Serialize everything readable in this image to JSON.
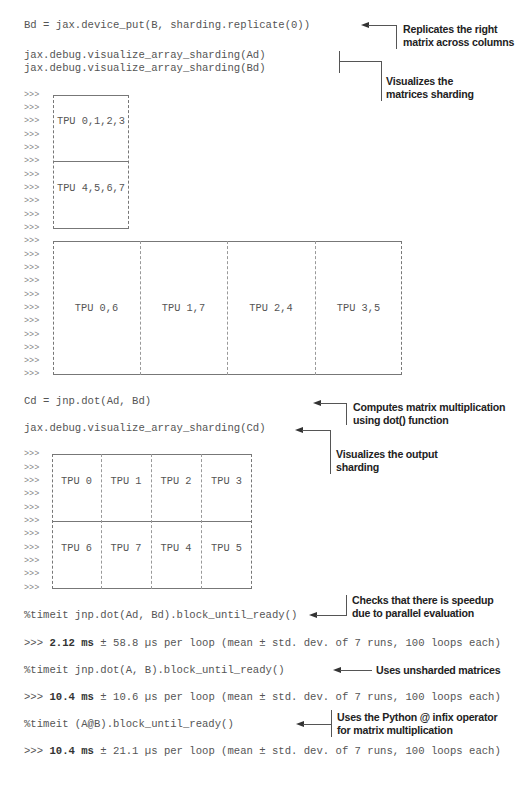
{
  "code": {
    "line_bd": "Bd = jax.device_put(B, sharding.replicate(0))",
    "line_vis_ad": "jax.debug.visualize_array_sharding(Ad)",
    "line_vis_bd": "jax.debug.visualize_array_sharding(Bd)",
    "line_cd": "Cd = jnp.dot(Ad, Bd)",
    "line_vis_cd": "jax.debug.visualize_array_sharding(Cd)",
    "timeit1": "%timeit jnp.dot(Ad, Bd).block_until_ready()",
    "result1_prefix": ">>> ",
    "result1_bold": "2.12 ms",
    "result1_rest": " ± 58.8 µs per loop (mean ± std. dev. of 7 runs, 100 loops each)",
    "timeit2": "%timeit jnp.dot(A, B).block_until_ready()",
    "result2_prefix": ">>> ",
    "result2_bold": "10.4 ms",
    "result2_rest": " ± 10.6 µs per loop (mean ± std. dev. of 7 runs, 100 loops each)",
    "timeit3": "%timeit (A@B).block_until_ready()",
    "result3_prefix": ">>> ",
    "result3_bold": "10.4 ms",
    "result3_rest": " ± 21.1 µs per loop (mean ± std. dev. of 7 runs, 100 loops each)"
  },
  "prompt": ">>>",
  "sharding_ad": {
    "cells": [
      "TPU 0,1,2,3",
      "TPU 4,5,6,7"
    ]
  },
  "sharding_bd": {
    "cells": [
      "TPU 0,6",
      "TPU 1,7",
      "TPU 2,4",
      "TPU 3,5"
    ]
  },
  "sharding_cd": {
    "rows": [
      [
        "TPU 0",
        "TPU 1",
        "TPU 2",
        "TPU 3"
      ],
      [
        "TPU 6",
        "TPU 7",
        "TPU 4",
        "TPU 5"
      ]
    ]
  },
  "annotations": {
    "replicates_1": "Replicates the right",
    "replicates_2": "matrix across columns",
    "visualizes_1": "Visualizes the",
    "visualizes_2": "matrices sharding",
    "computes_1": "Computes matrix multiplication",
    "computes_2": "using dot() function",
    "vis_output_1": "Visualizes the output",
    "vis_output_2": "sharding",
    "checks_1": "Checks that there is speedup",
    "checks_2": "due to parallel evaluation",
    "unsharded": "Uses unsharded  matrices",
    "python_1": "Uses the Python @ infix operator",
    "python_2": "for matrix multiplication"
  }
}
